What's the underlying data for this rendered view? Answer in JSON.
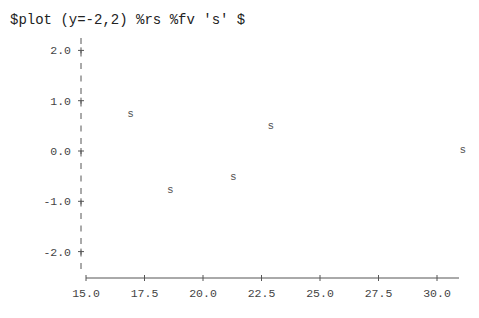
{
  "command": "$plot (y=-2,2) %rs %fv 's' $",
  "chart_data": {
    "type": "scatter",
    "title": "$plot (y=-2,2) %rs %fv 's' $",
    "xlabel": "",
    "ylabel": "",
    "marker": "s",
    "xlim": [
      15.0,
      31.5
    ],
    "ylim": [
      -2.0,
      2.0
    ],
    "x_ticks": [
      "15.0",
      "17.5",
      "20.0",
      "22.5",
      "25.0",
      "27.5",
      "30.0"
    ],
    "y_ticks": [
      "2.0",
      "1.0",
      "0.0",
      "-1.0",
      "-2.0"
    ],
    "grid": false,
    "legend": null,
    "points": [
      {
        "x": 16.9,
        "y": 0.76
      },
      {
        "x": 18.6,
        "y": -0.76
      },
      {
        "x": 21.3,
        "y": -0.5
      },
      {
        "x": 22.9,
        "y": 0.52
      },
      {
        "x": 31.1,
        "y": 0.04
      }
    ]
  }
}
